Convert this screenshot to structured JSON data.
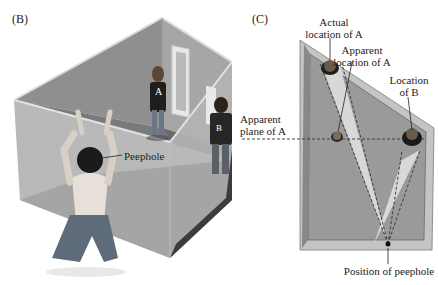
{
  "figure": {
    "panels": [
      {
        "id": "B",
        "tag": "(B)",
        "description": "3D cutaway view of distorted room with observer at peephole",
        "labels": {
          "peephole": "Peephole",
          "person_a": "A",
          "person_b": "B"
        }
      },
      {
        "id": "C",
        "tag": "(C)",
        "description": "Top-down plan view of the room",
        "labels": {
          "actual_location_a_line1": "Actual",
          "actual_location_a_line2": "location of A",
          "apparent_location_a_line1": "Apparent",
          "apparent_location_a_line2": "location of A",
          "location_b_line1": "Location",
          "location_b_line2": "of B",
          "apparent_plane_line1": "Apparent",
          "apparent_plane_line2": "plane of A",
          "peephole_position": "Position of peephole"
        }
      }
    ],
    "colors": {
      "wall_back": "#8c8c8c",
      "wall_side": "#a8a8a8",
      "wall_front": "#b4b4b4",
      "floor": "#6e6e6e",
      "floor_plan": "#9a9a9a",
      "rim": "#c8c8c8",
      "sightline_fill": "#e6e6e6",
      "dark": "#2a2a2a"
    }
  }
}
